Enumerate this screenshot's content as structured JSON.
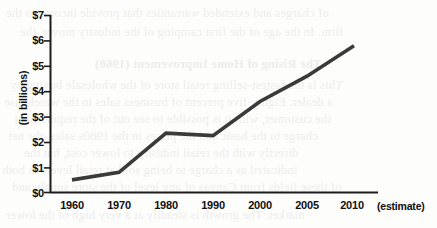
{
  "chart_data": {
    "type": "line",
    "title": "",
    "xlabel": "",
    "ylabel": "(in billions)",
    "categories": [
      "1960",
      "1970",
      "1980",
      "1990",
      "2000",
      "2005",
      "2010"
    ],
    "x_axis_suffix": "(estimate)",
    "values": [
      0.5,
      0.8,
      2.35,
      2.25,
      3.6,
      4.6,
      5.8
    ],
    "ylim": [
      0,
      7
    ],
    "y_ticks": [
      0,
      1,
      2,
      3,
      4,
      5,
      6,
      7
    ],
    "y_tick_labels": [
      "$0",
      "$1",
      "$2",
      "$3",
      "$4",
      "$5",
      "$6",
      "$7"
    ],
    "grid": false,
    "legend": false,
    "series": [
      {
        "name": "",
        "values": [
          0.5,
          0.8,
          2.35,
          2.25,
          3.6,
          4.6,
          5.8
        ]
      }
    ],
    "line_color": "#3a3a3a",
    "axis_color": "#1c1c1c"
  },
  "background_ghost_text": [
    "of charges and extended warranties that provide income to the",
    "firm. In the age of the first camping of the industry mover, the",
    "The Rising of Home Improvement (1960)",
    "This is the fastest-selling retail store of the wholesale buying by",
    "a dealer. Eighty-five percent of business sales in the warehouse",
    "the customer, with it is possible to see out of the requirement",
    "charge to the basic and the prices in the 1980s sales, the net",
    "directly with the retail industry to lower cost, but the",
    "indicated as a charge to being sold at retail levels in both",
    "of these fields from Canvas of any level of the store supply and",
    "market. The growth is steadily at a very high of the lower"
  ]
}
